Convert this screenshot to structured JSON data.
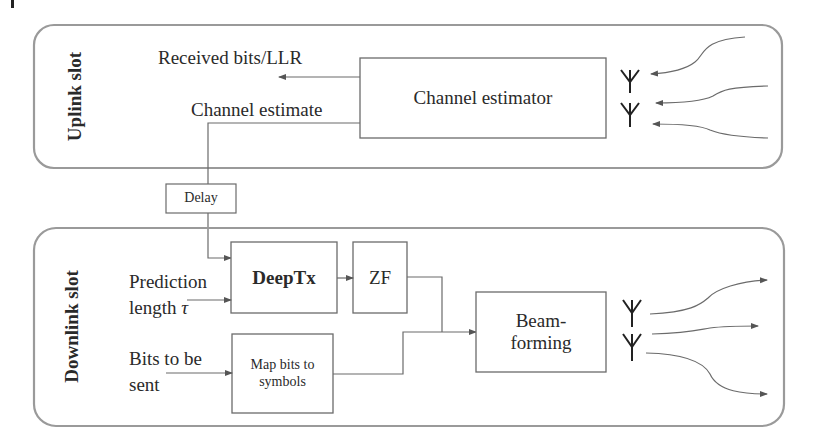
{
  "uplink": {
    "section_label": "Uplink slot",
    "received_label": "Received bits/LLR",
    "channel_estimate_label": "Channel estimate",
    "channel_estimator_label": "Channel estimator",
    "antenna_count": 2,
    "incoming_signal_count": 3
  },
  "delay": {
    "label": "Delay"
  },
  "downlink": {
    "section_label": "Downlink slot",
    "prediction_label_line1": "Prediction",
    "prediction_label_line2": "length",
    "prediction_symbol": "τ",
    "bits_label_line1": "Bits to be",
    "bits_label_line2": "sent",
    "deeptx_label": "DeepTx",
    "zf_label": "ZF",
    "map_label_line1": "Map bits to",
    "map_label_line2": "symbols",
    "beamforming_line1": "Beam-",
    "beamforming_line2": "forming",
    "antenna_count": 2,
    "outgoing_signal_count": 3
  },
  "colors": {
    "line": "#6b6b6b",
    "frame": "#9a9a9a",
    "text": "#2a2a2a",
    "antenna": "#222222"
  }
}
